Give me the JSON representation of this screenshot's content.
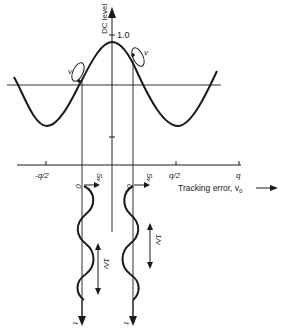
{
  "figure": {
    "y_axis_label": "DC level",
    "y_tick_label": "1.0",
    "x_axis_label": "Tracking error, v",
    "x_axis_label_subscript": "0",
    "x_tick_labels": [
      "-q/2",
      "q/2",
      "q"
    ],
    "rotation_label": "v",
    "signal_labels": {
      "origin": "0",
      "signal": "S",
      "signal_subscript": "v",
      "period": "1/v",
      "time": "t"
    },
    "colors": {
      "ink": "#1a1a1a",
      "background": "#ffffff"
    }
  }
}
